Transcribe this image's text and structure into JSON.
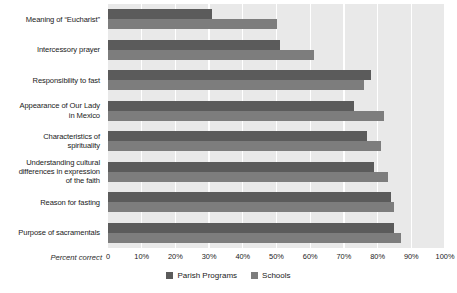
{
  "chart_data": {
    "type": "bar",
    "orientation": "horizontal",
    "title": "",
    "xlabel": "Percent correct",
    "ylabel": "",
    "xlim": [
      0,
      100
    ],
    "grid": true,
    "legend_position": "bottom-center",
    "xticks": [
      "0",
      "10%",
      "20%",
      "30%",
      "40%",
      "50%",
      "60%",
      "70%",
      "80%",
      "90%",
      "100%"
    ],
    "xtick_values": [
      0,
      10,
      20,
      30,
      40,
      50,
      60,
      70,
      80,
      90,
      100
    ],
    "categories": [
      "Meaning of “Eucharist”",
      "Intercessory prayer",
      "Responsibility to fast",
      "Appearance of Our Lady in Mexico",
      "Characteristics of spirituality",
      "Understanding cultural differences in expression of the faith",
      "Reason for fasting",
      "Purpose of sacramentals"
    ],
    "series": [
      {
        "name": "Parish Programs",
        "color": "#5b5b5b",
        "values": [
          31,
          51,
          78,
          73,
          77,
          79,
          84,
          85
        ]
      },
      {
        "name": "Schools",
        "color": "#7d7d7d",
        "values": [
          50,
          61,
          76,
          82,
          81,
          83,
          85,
          87
        ]
      }
    ]
  },
  "legend": {
    "items": [
      {
        "label": "Parish Programs",
        "color": "#5b5b5b"
      },
      {
        "label": "Schools",
        "color": "#7d7d7d"
      }
    ]
  },
  "colors": {
    "plot_background": "#e9e9e9",
    "gridline": "#ffffff",
    "page_background": "#ffffff",
    "text": "#1a1a1a"
  },
  "category_lines": [
    [
      "Meaning of “Eucharist”"
    ],
    [
      "Intercessory prayer"
    ],
    [
      "Responsibility to fast"
    ],
    [
      "Appearance of Our Lady",
      "in Mexico"
    ],
    [
      "Characteristics of",
      "spirituality"
    ],
    [
      "Understanding cultural",
      "differences in expression",
      "of the faith"
    ],
    [
      "Reason for fasting"
    ],
    [
      "Purpose of sacramentals"
    ]
  ]
}
